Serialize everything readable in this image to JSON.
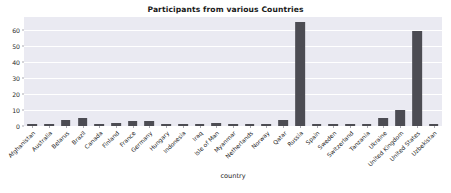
{
  "chart_data": {
    "type": "bar",
    "title": "Participants from various Countries",
    "xlabel": "country",
    "ylabel": "",
    "ylim": [
      0,
      68
    ],
    "grid": true,
    "legend": null,
    "bar_color": "#4c4c53",
    "plot_background": "#eaeaf2",
    "yticks": [
      0,
      10,
      20,
      30,
      40,
      50,
      60
    ],
    "categories": [
      "Afghanistan",
      "Australia",
      "Belarus",
      "Brazil",
      "Canada",
      "Finland",
      "France",
      "Germany",
      "Hungary",
      "Indonesia",
      "Iraq",
      "Isle of Man",
      "Myanmar",
      "Netherlands",
      "Norway",
      "Qatar",
      "Russia",
      "Spain",
      "Sweden",
      "Switzerland",
      "Tanzania",
      "Ukraine",
      "United Kingdom",
      "United States",
      "Uzbekistan"
    ],
    "values": [
      1,
      1,
      4,
      5,
      1,
      2,
      3,
      3,
      1,
      1,
      1,
      2,
      1,
      1,
      1,
      4,
      65,
      1,
      1,
      1,
      1,
      5,
      10,
      59,
      1
    ]
  }
}
